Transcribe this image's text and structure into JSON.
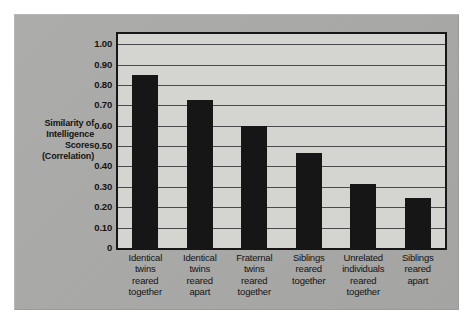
{
  "chart_data": {
    "type": "bar",
    "title": "",
    "subtitle": "",
    "xlabel": "",
    "ylabel": "Similarity of Intelligence Scores (Correlation)",
    "ylabel_lines": [
      "Similarity of",
      "Intelligence",
      "Scores",
      "(Correlation)"
    ],
    "ylim": [
      0,
      1.05
    ],
    "y_ticks": [
      0,
      0.1,
      0.2,
      0.3,
      0.4,
      0.5,
      0.6,
      0.7,
      0.8,
      0.9,
      1.0
    ],
    "y_tick_labels": [
      "0",
      "0.10",
      "0.20",
      "0.30",
      "0.40",
      "0.50",
      "0.60",
      "0.70",
      "0.80",
      "0.90",
      "1.00"
    ],
    "grid": true,
    "grid_axis": "y",
    "legend": false,
    "legend_position": "none",
    "bar_color": "#161616",
    "plot_background": "#d4d4d1",
    "panel_background": "#a8a8a6",
    "categories": [
      "Identical twins reared together",
      "Identical twins reared apart",
      "Fraternal twins reared together",
      "Siblings reared together",
      "Unrelated individuals reared together",
      "Siblings reared apart"
    ],
    "category_lines": [
      [
        "Identical",
        "twins",
        "reared",
        "together"
      ],
      [
        "Identical",
        "twins",
        "reared",
        "apart"
      ],
      [
        "Fraternal",
        "twins",
        "reared",
        "together"
      ],
      [
        "Siblings",
        "reared",
        "together"
      ],
      [
        "Unrelated",
        "individuals",
        "reared",
        "together"
      ],
      [
        "Siblings",
        "reared",
        "apart"
      ]
    ],
    "values": [
      0.85,
      0.725,
      0.6,
      0.465,
      0.315,
      0.245
    ]
  }
}
